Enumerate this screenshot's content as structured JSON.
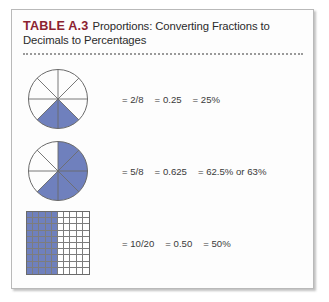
{
  "card": {
    "table_number": "TABLE A.3",
    "title_line_1": "Proportions: Converting Fractions to",
    "title_line_2": "Decimals to Percentages"
  },
  "colors": {
    "table_number": "#8c2230",
    "shade_blue": "#6f80bd",
    "line_gray": "#6a6a6a",
    "card_border": "#b9b9b9"
  },
  "rows": [
    {
      "figure": {
        "kind": "pie",
        "slices": 8,
        "shaded": 2,
        "shaded_start_slice": 3,
        "label": "pie-two-eighths"
      },
      "fraction": "= 2/8",
      "decimal": "= 0.25",
      "percent": "= 25%"
    },
    {
      "figure": {
        "kind": "pie",
        "slices": 8,
        "shaded": 5,
        "shaded_start_slice": 0,
        "label": "pie-five-eighths"
      },
      "fraction": "= 5/8",
      "decimal": "= 0.625",
      "percent": "= 62.5% or 63%"
    },
    {
      "figure": {
        "kind": "grid",
        "columns": 10,
        "rows": 10,
        "shaded_columns": 5,
        "label": "grid-ten-twentieths"
      },
      "fraction": "= 10/20",
      "decimal": "= 0.50",
      "percent": "= 50%"
    }
  ]
}
